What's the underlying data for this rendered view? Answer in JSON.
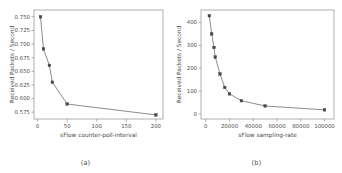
{
  "figure": {
    "panels": [
      {
        "caption": "(a)",
        "chart_index": 0
      },
      {
        "caption": "(b)",
        "chart_index": 1
      }
    ]
  },
  "chart_data": [
    {
      "type": "line",
      "title": "",
      "xlabel": "sFlow counter-poll-interval",
      "ylabel": "Received Packets / Second",
      "x": [
        5,
        10,
        20,
        25,
        50,
        200
      ],
      "values": [
        0.75,
        0.691,
        0.661,
        0.63,
        0.59,
        0.57
      ],
      "xlim": [
        -6,
        212
      ],
      "ylim": [
        0.5625,
        0.7625
      ],
      "xticks": [
        0,
        50,
        100,
        150,
        200
      ],
      "xtick_labels": [
        "0",
        "50",
        "100",
        "150",
        "200"
      ],
      "yticks": [
        0.575,
        0.6,
        0.625,
        0.65,
        0.675,
        0.7,
        0.725,
        0.75
      ],
      "ytick_labels": [
        "0.575",
        "0.600",
        "0.625",
        "0.650",
        "0.675",
        "0.700",
        "0.725",
        "0.750"
      ],
      "grid": false,
      "legend": "none",
      "marker": "square",
      "line_color": "#6e6e6e",
      "marker_color": "#4a4a4a"
    },
    {
      "type": "line",
      "title": "",
      "xlabel": "sFlow sampling-rate",
      "ylabel": "Received Packets / Second",
      "x": [
        3000,
        5000,
        7000,
        8000,
        12000,
        16000,
        20000,
        30000,
        50000,
        100000
      ],
      "values": [
        430,
        350,
        291,
        249,
        175,
        116,
        88,
        58,
        35,
        18
      ],
      "xlim": [
        -4000,
        108000
      ],
      "ylim": [
        -22,
        455
      ],
      "xticks": [
        0,
        20000,
        40000,
        60000,
        80000,
        100000
      ],
      "xtick_labels": [
        "0",
        "20000",
        "40000",
        "60000",
        "80000",
        "100000"
      ],
      "yticks": [
        0,
        100,
        200,
        300,
        400
      ],
      "ytick_labels": [
        "0",
        "100",
        "200",
        "300",
        "400"
      ],
      "grid": false,
      "legend": "none",
      "marker": "square",
      "line_color": "#6e6e6e",
      "marker_color": "#4a4a4a"
    }
  ]
}
